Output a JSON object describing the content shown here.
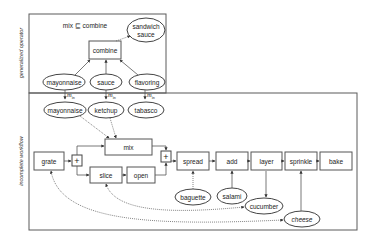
{
  "sections": {
    "top_label": "generalized operator",
    "bottom_label": "incomplete workflow"
  },
  "generalized_operator": {
    "annotation": "mix ⊑ combine",
    "operator": "combine",
    "output": [
      "sandwich",
      "sauce"
    ],
    "inputs": [
      "mayonnaise",
      "sauce",
      "flavoring"
    ]
  },
  "mapping_label": {
    "base": "m",
    "sub": "in"
  },
  "instantiated_inputs": [
    "mayonnaise",
    "ketchup",
    "tabasco"
  ],
  "workflow": {
    "operators": {
      "grate": "grate",
      "mix": "mix",
      "slice": "slice",
      "open": "open",
      "spread": "spread",
      "add": "add",
      "layer": "layer",
      "sprinkle": "sprinkle",
      "bake": "bake"
    },
    "junction_symbol": "+",
    "ingredients": {
      "baguette": "baguette",
      "salami": "salami",
      "cucumber": "cucumber",
      "cheese": "cheese"
    }
  },
  "colors": {
    "stroke": "#555555",
    "background": "#ffffff",
    "text": "#222222"
  }
}
